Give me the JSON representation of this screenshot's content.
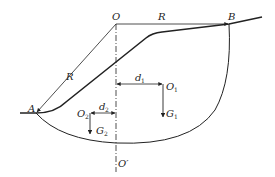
{
  "diagram": {
    "type": "slope-stability-circular-slip",
    "colors": {
      "line": "#222222",
      "background": "#ffffff"
    },
    "labels": {
      "center": "O",
      "center_prime": "O′",
      "point_a": "A",
      "point_b": "B",
      "radius_top": "R",
      "radius_left": "R",
      "d1": "d",
      "d1_sub": "1",
      "d2": "d",
      "d2_sub": "2",
      "o1": "O",
      "o1_sub": "1",
      "o2": "O",
      "o2_sub": "2",
      "g1": "G",
      "g1_sub": "1",
      "g2": "G",
      "g2_sub": "2"
    }
  }
}
